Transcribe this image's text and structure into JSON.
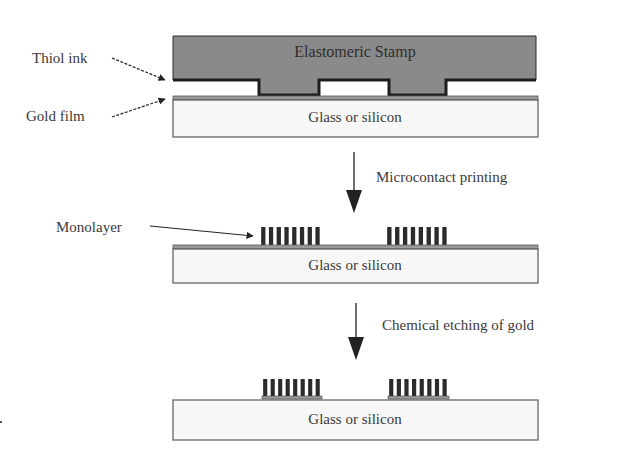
{
  "figure": {
    "colors": {
      "background": "#ffffff",
      "stamp_fill": "#8a8a8a",
      "stamp_outline": "#2a2a2a",
      "ink_line": "#1e1e1e",
      "substrate_fill": "#f7f7f7",
      "substrate_outline": "#5a5a5a",
      "gold_film": "#9a9a9a",
      "monolayer": "#2b2b2b",
      "text": "#3a3a3a",
      "arrow": "#222222"
    }
  },
  "stage1": {
    "stamp_label": "Elastomeric Stamp",
    "substrate_label": "Glass or silicon",
    "callouts": [
      {
        "label": "Thiol ink"
      },
      {
        "label": "Gold film"
      }
    ]
  },
  "step1": {
    "label": "Microcontact printing"
  },
  "stage2": {
    "substrate_label": "Glass or silicon",
    "callouts": [
      {
        "label": "Monolayer"
      }
    ],
    "monolayer_blocks": 2,
    "bars_per_block": 8
  },
  "step2": {
    "label": "Chemical etching of gold"
  },
  "stage3": {
    "substrate_label": "Glass or silicon",
    "monolayer_blocks": 2,
    "bars_per_block": 8
  }
}
